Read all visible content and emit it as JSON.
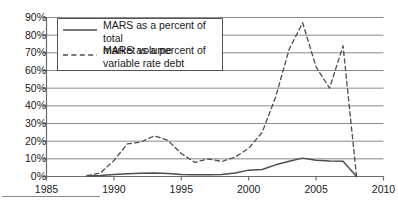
{
  "chart_data": {
    "type": "line",
    "title": "",
    "subtitle": "",
    "xlabel": "",
    "ylabel": "",
    "xlim": [
      1985,
      2010
    ],
    "ylim": [
      0,
      90
    ],
    "grid": true,
    "grid_axis": "y",
    "legend_position": "top-left-inset",
    "x_ticks": [
      "1985",
      "1990",
      "1995",
      "2000",
      "2005",
      "2010"
    ],
    "x_tick_values": [
      1985,
      1990,
      1995,
      2000,
      2005,
      2010
    ],
    "y_ticks": [
      "0%",
      "10%",
      "20%",
      "30%",
      "40%",
      "50%",
      "60%",
      "70%",
      "80%",
      "90%"
    ],
    "y_tick_values": [
      0,
      10,
      20,
      30,
      40,
      50,
      60,
      70,
      80,
      90
    ],
    "series": [
      {
        "name": "MARS as a percent of total market volume",
        "style": "solid",
        "color": "#4d4d4d",
        "x": [
          1988,
          1989,
          1990,
          1991,
          1992,
          1993,
          1994,
          1995,
          1996,
          1997,
          1998,
          1999,
          2000,
          2001,
          2002,
          2003,
          2004,
          2005,
          2006,
          2007,
          2008
        ],
        "values": [
          0.3,
          0.6,
          1.2,
          1.6,
          1.8,
          2.0,
          1.7,
          1.2,
          1.0,
          1.0,
          1.2,
          2.0,
          3.6,
          4.0,
          6.6,
          8.6,
          10.4,
          9.2,
          8.8,
          8.6,
          0.0
        ]
      },
      {
        "name": "MARS as a percent of variable rate debt",
        "style": "dashed",
        "color": "#4d4d4d",
        "x": [
          1988,
          1989,
          1990,
          1991,
          1992,
          1993,
          1994,
          1995,
          1996,
          1997,
          1998,
          1999,
          2000,
          2001,
          2002,
          2003,
          2004,
          2005,
          2006,
          2007,
          2008
        ],
        "values": [
          0.5,
          2.0,
          9.0,
          18.5,
          19.5,
          23.0,
          20.5,
          13.0,
          8.0,
          10.0,
          8.5,
          11.0,
          16.0,
          25.0,
          45.0,
          72.0,
          87.0,
          62.0,
          50.0,
          74.0,
          0.0
        ]
      }
    ]
  },
  "legend": {
    "entries": [
      {
        "label_line1": "MARS as a percent of total",
        "label_line2": "market volume",
        "style": "solid"
      },
      {
        "label_line1": "MARS as a percent of",
        "label_line2": "variable rate debt",
        "style": "dashed"
      }
    ]
  },
  "colors": {
    "line": "#4d4d4d",
    "grid": "#8a8a8a",
    "axis": "#6b6b6b",
    "text": "#1a1a1a",
    "legend_border": "#555555",
    "background": "#ffffff"
  }
}
